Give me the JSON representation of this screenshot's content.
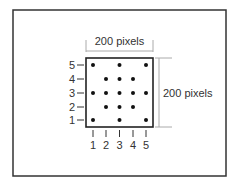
{
  "diagram": {
    "width_label": "200 pixels",
    "height_label": "200 pixels",
    "x_ticks": [
      "1",
      "2",
      "3",
      "4",
      "5"
    ],
    "y_ticks": [
      "1",
      "2",
      "3",
      "4",
      "5"
    ],
    "points": [
      {
        "x": 1,
        "y": 5
      },
      {
        "x": 3,
        "y": 5
      },
      {
        "x": 5,
        "y": 5
      },
      {
        "x": 2,
        "y": 4
      },
      {
        "x": 3,
        "y": 4
      },
      {
        "x": 4,
        "y": 4
      },
      {
        "x": 1,
        "y": 3
      },
      {
        "x": 2,
        "y": 3
      },
      {
        "x": 3,
        "y": 3
      },
      {
        "x": 4,
        "y": 3
      },
      {
        "x": 5,
        "y": 3
      },
      {
        "x": 2,
        "y": 2
      },
      {
        "x": 3,
        "y": 2
      },
      {
        "x": 4,
        "y": 2
      },
      {
        "x": 1,
        "y": 1
      },
      {
        "x": 3,
        "y": 1
      },
      {
        "x": 5,
        "y": 1
      }
    ],
    "colors": {
      "frame": "#333333",
      "square": "#222222",
      "dim_line": "#aaaaaa",
      "dot": "#111111",
      "text": "#333333"
    }
  }
}
